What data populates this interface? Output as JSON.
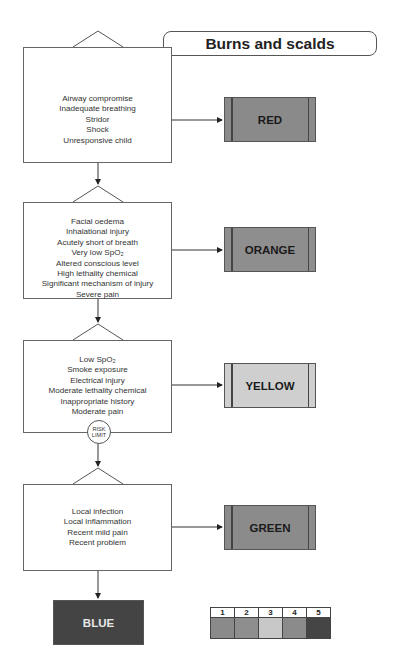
{
  "title": "Burns and scalds",
  "colors": {
    "red": "#8a8a8a",
    "orange": "#8e8e8e",
    "yellow": "#cfcfcf",
    "green": "#8b8b8b",
    "blue": "#444444"
  },
  "blocks": [
    {
      "id": "red",
      "criteria": [
        "Airway compromise",
        "Inadequate breathing",
        "Stridor",
        "Shock",
        "Unresponsive child"
      ],
      "outcome": "RED"
    },
    {
      "id": "orange",
      "criteria": [
        "Facial oedema",
        "Inhalational injury",
        "Acutely short of breath",
        "Very low SpO₂",
        "Altered conscious level",
        "High lethality chemical",
        "Significant mechanism of injury",
        "Severe pain"
      ],
      "outcome": "ORANGE"
    },
    {
      "id": "yellow",
      "criteria": [
        "Low SpO₂",
        "Smoke exposure",
        "Electrical injury",
        "Moderate lethality chemical",
        "Inappropriate history",
        "Moderate pain"
      ],
      "outcome": "YELLOW"
    },
    {
      "id": "green",
      "criteria": [
        "Local infection",
        "Local inflammation",
        "Recent mild pain",
        "Recent problem"
      ],
      "outcome": "GREEN"
    }
  ],
  "risk_limit": {
    "line1": "RISK",
    "line2": "LIMIT"
  },
  "final_outcome": "BLUE",
  "legend": {
    "numbers": [
      "1",
      "2",
      "3",
      "4",
      "5"
    ],
    "swatches": [
      "#8a8a8a",
      "#8e8e8e",
      "#c8c8c8",
      "#8b8b8b",
      "#454545"
    ]
  }
}
